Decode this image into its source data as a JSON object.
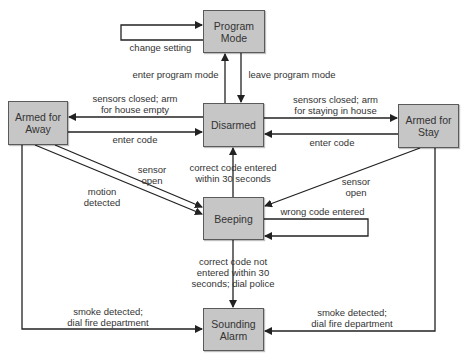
{
  "diagram": {
    "type": "state-transition",
    "colors": {
      "box_fill": "#c6c6c6",
      "box_border": "#5a5a5a",
      "line": "#222222",
      "text": "#333333"
    },
    "states": {
      "program_mode": "Program\nMode",
      "disarmed": "Disarmed",
      "armed_away": "Armed for\nAway",
      "armed_stay": "Armed for\nStay",
      "beeping": "Beeping",
      "sounding_alarm": "Sounding\nAlarm"
    },
    "transitions": {
      "change_setting": "change setting",
      "enter_program_mode": "enter program mode",
      "leave_program_mode": "leave program mode",
      "arm_away": "sensors closed; arm\nfor house empty",
      "away_enter_code": "enter code",
      "arm_stay": "sensors closed; arm\nfor staying in house",
      "stay_enter_code": "enter code",
      "away_sensor_open": "sensor\nopen",
      "motion_detected": "motion\ndetected",
      "stay_sensor_open": "sensor\nopen",
      "correct_code": "correct code entered\nwithin 30 seconds",
      "wrong_code": "wrong code entered",
      "timeout": "correct code not\nentered within 30\nseconds; dial police",
      "smoke_left": "smoke detected;\ndial fire department",
      "smoke_right": "smoke detected;\ndial fire department"
    }
  }
}
